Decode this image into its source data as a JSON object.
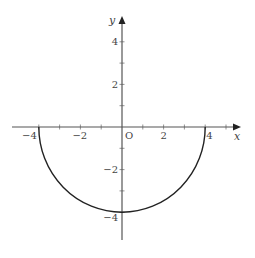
{
  "chart_data": {
    "type": "line",
    "title": "",
    "xlabel": "x",
    "ylabel": "y",
    "origin_label": "O",
    "xlim": [
      -5.2,
      5.6
    ],
    "ylim": [
      -5.4,
      5.2
    ],
    "grid": false,
    "legend": null,
    "x_ticks": [
      -4,
      -3,
      -2,
      -1,
      1,
      2,
      3,
      4,
      5
    ],
    "x_tick_labels": [
      {
        "value": -4,
        "label": "−4"
      },
      {
        "value": -2,
        "label": "−2"
      },
      {
        "value": 2,
        "label": "2"
      },
      {
        "value": 4,
        "label": "4"
      }
    ],
    "y_ticks": [
      -4,
      -3,
      -2,
      -1,
      1,
      2,
      3,
      4
    ],
    "y_tick_labels": [
      {
        "value": 4,
        "label": "4"
      },
      {
        "value": 2,
        "label": "2"
      },
      {
        "value": -2,
        "label": "−2"
      },
      {
        "value": -4,
        "label": "−4"
      }
    ],
    "series": [
      {
        "name": "lower semicircle x^2 + y^2 = 16, y <= 0",
        "x": [
          -4,
          -3.5,
          -3,
          -2,
          -1,
          0,
          1,
          2,
          3,
          3.5,
          4
        ],
        "y": [
          0,
          -1.94,
          -2.65,
          -3.46,
          -3.87,
          -4,
          -3.87,
          -3.46,
          -2.65,
          -1.94,
          0
        ],
        "color": "#222222"
      }
    ]
  }
}
